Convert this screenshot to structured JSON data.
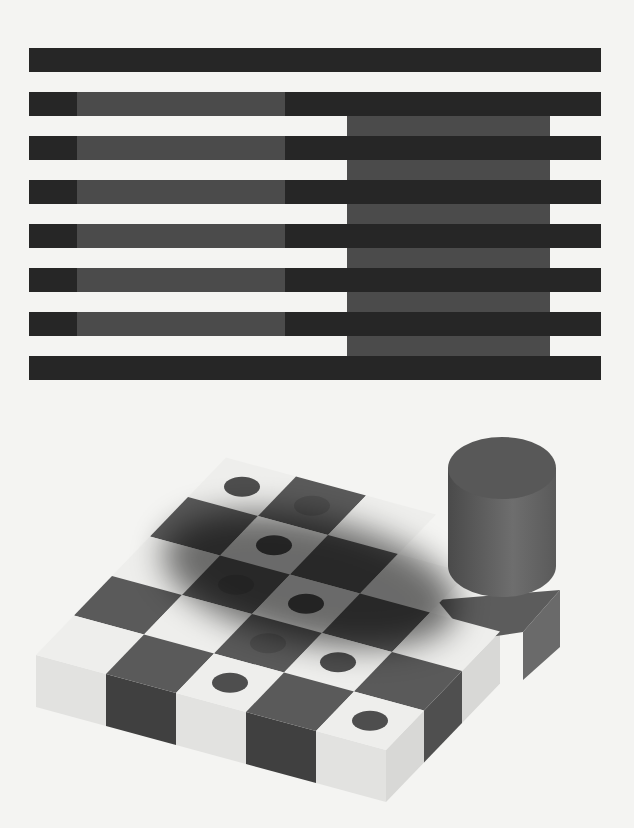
{
  "figure": {
    "background": "#f4f4f2",
    "whites_illusion": {
      "stripe_color": "#262626",
      "grey_color": "#4b4b4b",
      "x_left": 29,
      "x_right": 601,
      "stripe_height": 24,
      "stripe_tops": [
        48,
        92,
        136,
        180,
        224,
        268,
        312,
        356
      ],
      "left_grey": {
        "x": 77,
        "width": 208,
        "on_stripe_indices": [
          1,
          2,
          3,
          4,
          5,
          6
        ]
      },
      "right_grey": {
        "x": 347,
        "width": 203,
        "gap_top": 116,
        "gap_bottom": 356
      }
    },
    "checker_illusion": {
      "light_color": "#eeeeec",
      "dark_color": "#5a5a5a",
      "dot_color": "#4e4e4e",
      "origin": [
        188,
        497
      ],
      "u": [
        70,
        19
      ],
      "v": [
        -38,
        39.5
      ],
      "thickness": 52,
      "cells": [
        {
          "r": -1,
          "c": 0,
          "dark": false,
          "dot": true
        },
        {
          "r": -1,
          "c": 1,
          "dark": true,
          "dot": true
        },
        {
          "r": -1,
          "c": 2,
          "dark": false,
          "dot": false
        },
        {
          "r": 0,
          "c": 0,
          "dark": true,
          "dot": false
        },
        {
          "r": 0,
          "c": 1,
          "dark": false,
          "dot": true
        },
        {
          "r": 0,
          "c": 2,
          "dark": true,
          "dot": false
        },
        {
          "r": 0,
          "c": 3,
          "dark": false,
          "dot": false
        },
        {
          "r": 1,
          "c": 0,
          "dark": false,
          "dot": false
        },
        {
          "r": 1,
          "c": 1,
          "dark": true,
          "dot": true
        },
        {
          "r": 1,
          "c": 2,
          "dark": false,
          "dot": true
        },
        {
          "r": 1,
          "c": 3,
          "dark": true,
          "dot": false
        },
        {
          "r": 1,
          "c": 4,
          "dark": false,
          "dot": false
        },
        {
          "r": 2,
          "c": 0,
          "dark": true,
          "dot": false
        },
        {
          "r": 2,
          "c": 1,
          "dark": false,
          "dot": false
        },
        {
          "r": 2,
          "c": 2,
          "dark": true,
          "dot": true
        },
        {
          "r": 2,
          "c": 3,
          "dark": false,
          "dot": true
        },
        {
          "r": 2,
          "c": 4,
          "dark": true,
          "dot": false
        },
        {
          "r": 3,
          "c": 0,
          "dark": false,
          "dot": false
        },
        {
          "r": 3,
          "c": 1,
          "dark": true,
          "dot": false
        },
        {
          "r": 3,
          "c": 2,
          "dark": false,
          "dot": true
        },
        {
          "r": 3,
          "c": 3,
          "dark": true,
          "dot": false
        },
        {
          "r": 3,
          "c": 4,
          "dark": false,
          "dot": true
        }
      ],
      "front_row": 3,
      "right_col": 4,
      "shadow": {
        "cx": 310,
        "cy": 580,
        "rx": 150,
        "ry": 62,
        "rotate": 12,
        "opacity": 0.55
      },
      "cylinder": {
        "cx": 502,
        "top_cy": 468,
        "bottom_cy": 566,
        "rx": 54,
        "ry": 31,
        "side_color_left": "#4a4a4a",
        "side_color_right": "#6e6e6e",
        "top_color": "#585858"
      },
      "right_block": {
        "points_top": [
          [
            437,
            600
          ],
          [
            560,
            590
          ],
          [
            523,
            632
          ],
          [
            470,
            640
          ]
        ],
        "points_side": [
          [
            523,
            632
          ],
          [
            560,
            590
          ],
          [
            560,
            647
          ],
          [
            523,
            680
          ]
        ],
        "top_color": "#5c5c5c",
        "side_color": "#6a6a6a"
      }
    }
  }
}
